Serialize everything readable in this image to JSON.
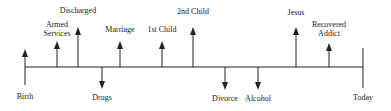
{
  "diagram": {
    "type": "life-timeline",
    "colors": {
      "line": "#222222",
      "text": "#222222",
      "background": "#ffffff"
    },
    "axis": {
      "y": 67,
      "x_start": 25,
      "x_end": 363
    },
    "start": {
      "label": "Birth",
      "x": 25
    },
    "end": {
      "label": "Today",
      "x": 363
    },
    "events": [
      {
        "id": "birth",
        "label": "Birth",
        "x": 25,
        "direction": "up",
        "tip_y": 49,
        "label_y": 92
      },
      {
        "id": "armed-services",
        "label": "Armed\nServices",
        "x": 57,
        "direction": "up",
        "tip_y": 41,
        "label_y": 20
      },
      {
        "id": "discharged",
        "label": "Discharged",
        "x": 78,
        "direction": "up",
        "tip_y": 27,
        "label_y": 6
      },
      {
        "id": "drugs",
        "label": "Drugs",
        "x": 102,
        "direction": "down",
        "tip_y": 89,
        "label_y": 93
      },
      {
        "id": "marriage",
        "label": "Marriage",
        "x": 120,
        "direction": "up",
        "tip_y": 41,
        "label_y": 25
      },
      {
        "id": "first-child",
        "label": "1st Child",
        "x": 162,
        "direction": "up",
        "tip_y": 41,
        "label_y": 25
      },
      {
        "id": "second-child",
        "label": "2nd Child",
        "x": 193,
        "direction": "up",
        "tip_y": 27,
        "label_y": 7
      },
      {
        "id": "divorce",
        "label": "Divorce",
        "x": 225,
        "direction": "down",
        "tip_y": 90,
        "label_y": 94
      },
      {
        "id": "alcohol",
        "label": "Alcohol",
        "x": 258,
        "direction": "down",
        "tip_y": 90,
        "label_y": 94
      },
      {
        "id": "jesus",
        "label": "Jesus",
        "x": 296,
        "direction": "up",
        "tip_y": 27,
        "label_y": 8
      },
      {
        "id": "recovered-addict",
        "label": "Recovered\nAddict",
        "x": 329,
        "direction": "up",
        "tip_y": 43,
        "label_y": 20
      },
      {
        "id": "today",
        "label": "Today",
        "x": 363,
        "direction": "none",
        "tip_y": 48,
        "label_y": 93
      }
    ]
  }
}
